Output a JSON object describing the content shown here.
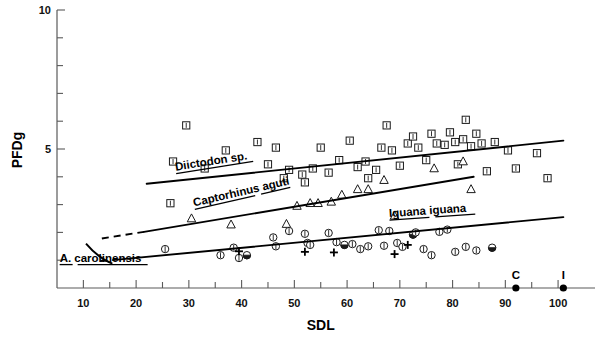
{
  "chart_data": {
    "type": "scatter",
    "title": "",
    "xlabel": "SDL",
    "ylabel": "PFDg",
    "xlim": [
      5,
      107
    ],
    "ylim": [
      0,
      10
    ],
    "grid": false,
    "legend_position": "inline-curve-labels",
    "x_ticks_major": [
      10,
      20,
      30,
      40,
      50,
      60,
      70,
      80,
      90,
      100
    ],
    "x_ticks_major_labels": [
      "10",
      "20",
      "30",
      "40",
      "50",
      "60",
      "70",
      "80",
      "90",
      "100"
    ],
    "x_ticks_minor": [
      15,
      25,
      35,
      45,
      55,
      65,
      75,
      85,
      95
    ],
    "y_ticks_major": [
      5,
      10
    ],
    "y_ticks_major_labels": [
      "5",
      "10"
    ],
    "y_ticks_minor": [
      1,
      2,
      3,
      4,
      6,
      7,
      8,
      9
    ],
    "series": [
      {
        "name": "Diictodon sp.",
        "marker": "square-with-bar",
        "label": "Diictodon sp.",
        "label_underlined": true,
        "label_x": 27.5,
        "label_y": 4.22,
        "label_rotation": -9,
        "points": [
          [
            27.0,
            4.55
          ],
          [
            33.0,
            4.3
          ],
          [
            26.5,
            3.05
          ],
          [
            29.5,
            5.85
          ],
          [
            37.0,
            4.95
          ],
          [
            43.0,
            5.25
          ],
          [
            46.5,
            5.05
          ],
          [
            45.0,
            4.45
          ],
          [
            49.0,
            4.25
          ],
          [
            48.0,
            3.95
          ],
          [
            51.5,
            4.08
          ],
          [
            52.0,
            3.8
          ],
          [
            53.5,
            4.3
          ],
          [
            55.0,
            5.05
          ],
          [
            56.5,
            4.15
          ],
          [
            58.5,
            4.6
          ],
          [
            60.5,
            5.3
          ],
          [
            62.0,
            4.35
          ],
          [
            63.5,
            4.55
          ],
          [
            64.0,
            3.95
          ],
          [
            65.5,
            4.25
          ],
          [
            66.5,
            5.05
          ],
          [
            67.5,
            5.85
          ],
          [
            68.5,
            4.95
          ],
          [
            70.0,
            4.4
          ],
          [
            71.5,
            5.2
          ],
          [
            72.5,
            5.45
          ],
          [
            73.5,
            5.05
          ],
          [
            75.0,
            4.6
          ],
          [
            76.0,
            5.55
          ],
          [
            77.0,
            5.2
          ],
          [
            78.5,
            5.15
          ],
          [
            79.5,
            5.6
          ],
          [
            80.5,
            5.25
          ],
          [
            81.0,
            4.45
          ],
          [
            82.0,
            5.35
          ],
          [
            82.5,
            6.05
          ],
          [
            83.5,
            5.1
          ],
          [
            84.5,
            5.55
          ],
          [
            85.5,
            5.2
          ],
          [
            86.5,
            4.2
          ],
          [
            88.0,
            5.25
          ],
          [
            90.5,
            4.95
          ],
          [
            92.0,
            4.3
          ],
          [
            96.0,
            4.85
          ],
          [
            98.0,
            3.95
          ]
        ],
        "trend": {
          "x0": 22.0,
          "y0": 3.75,
          "x1": 101.0,
          "y1": 5.3
        }
      },
      {
        "name": "Captorhinus aguti",
        "marker": "triangle-open",
        "label": "Captorhinus aguti",
        "label_underlined": true,
        "label_x": 31.0,
        "label_y": 2.93,
        "label_rotation": -13,
        "points": [
          [
            30.5,
            2.5
          ],
          [
            38.0,
            2.28
          ],
          [
            48.5,
            2.3
          ],
          [
            50.5,
            2.95
          ],
          [
            53.0,
            3.05
          ],
          [
            54.5,
            3.05
          ],
          [
            57.0,
            3.1
          ],
          [
            59.0,
            3.35
          ],
          [
            62.0,
            3.55
          ],
          [
            64.0,
            3.55
          ],
          [
            67.0,
            3.88
          ],
          [
            69.0,
            2.6
          ],
          [
            76.5,
            4.3
          ],
          [
            82.0,
            4.55
          ],
          [
            83.5,
            3.55
          ]
        ],
        "trend": {
          "x0": 21.5,
          "y0": 2.02,
          "x1": 84.0,
          "y1": 4.0
        },
        "trend_dashed": {
          "x0": 13.5,
          "y0": 1.78,
          "x1": 21.5,
          "y1": 2.02
        }
      },
      {
        "name": "Iguana iguana",
        "marker": "circle-with-bar",
        "label": "Iguana iguana",
        "label_underlined": true,
        "label_x": 68.0,
        "label_y": 2.55,
        "label_rotation": -4,
        "points": [
          [
            25.5,
            1.4
          ],
          [
            36.0,
            1.18
          ],
          [
            38.5,
            1.45
          ],
          [
            39.5,
            1.08
          ],
          [
            41.0,
            1.18
          ],
          [
            46.0,
            1.82
          ],
          [
            46.5,
            1.5
          ],
          [
            49.0,
            2.05
          ],
          [
            52.0,
            1.95
          ],
          [
            52.5,
            1.62
          ],
          [
            53.0,
            1.55
          ],
          [
            56.5,
            1.98
          ],
          [
            58.0,
            1.65
          ],
          [
            59.5,
            1.55
          ],
          [
            61.0,
            1.58
          ],
          [
            62.5,
            1.4
          ],
          [
            64.0,
            1.5
          ],
          [
            66.0,
            2.08
          ],
          [
            67.0,
            1.52
          ],
          [
            68.0,
            2.05
          ],
          [
            69.5,
            1.62
          ],
          [
            70.5,
            1.48
          ],
          [
            72.5,
            1.92
          ],
          [
            73.0,
            2.0
          ],
          [
            74.5,
            1.4
          ],
          [
            76.0,
            1.18
          ],
          [
            77.5,
            2.02
          ],
          [
            79.0,
            2.1
          ],
          [
            80.5,
            1.3
          ],
          [
            82.5,
            1.48
          ],
          [
            84.5,
            1.35
          ],
          [
            87.5,
            1.45
          ]
        ],
        "trend": {
          "x0": 16.5,
          "y0": 1.02,
          "x1": 101.0,
          "y1": 2.55
        },
        "trend_dashed": {
          "x0": 13.2,
          "y0": 0.97,
          "x1": 16.5,
          "y1": 1.02
        }
      },
      {
        "name": "A. carolinensis",
        "marker": "plus",
        "label": "A. carolinensis",
        "label_underlined": true,
        "label_x": 5.5,
        "label_y": 0.95,
        "label_rotation": 0,
        "points": [
          [
            39.5,
            1.32
          ],
          [
            52.0,
            1.3
          ],
          [
            57.5,
            1.28
          ],
          [
            69.0,
            1.22
          ],
          [
            71.5,
            1.55
          ]
        ],
        "arc": {
          "x0": 10.5,
          "y0": 1.6,
          "cx": 13.0,
          "cy": 1.05,
          "x1": 15.5,
          "y1": 0.88
        }
      }
    ],
    "axis_markers": [
      {
        "label": "C",
        "x": 92.0,
        "marker": "filled-dot"
      },
      {
        "label": "I",
        "x": 101.0,
        "marker": "filled-dot"
      }
    ]
  },
  "colors": {
    "axis": "#5a5a5a",
    "ink": "#000000",
    "marker_stroke": "#1a1a1a",
    "background": "#ffffff"
  }
}
